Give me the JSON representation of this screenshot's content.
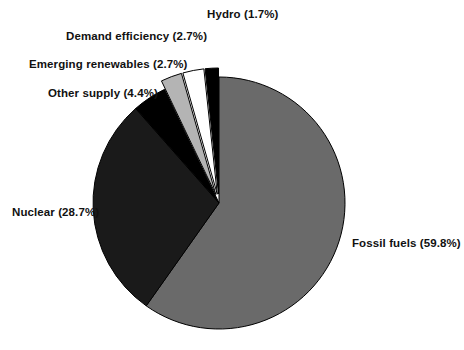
{
  "chart_data": {
    "type": "pie",
    "title": "",
    "subtitle": "",
    "xlabel": "",
    "ylabel": "",
    "legend_position": "none",
    "grid": false,
    "label_format": "{name} ({value}%)",
    "total_percent": 100.0,
    "categories": [
      "Fossil fuels",
      "Nuclear",
      "Other supply",
      "Emerging renewables",
      "Demand efficiency",
      "Hydro"
    ],
    "values": [
      59.8,
      28.7,
      4.4,
      2.7,
      2.7,
      1.7
    ],
    "slices": [
      {
        "name": "Fossil fuels",
        "value": 59.8,
        "label": "Fossil fuels (59.8%)",
        "fill": "#6a6a6a",
        "stroke": "#000000",
        "exploded": false
      },
      {
        "name": "Nuclear",
        "value": 28.7,
        "label": "Nuclear (28.7%)",
        "fill": "#1a1a1a",
        "stroke": "#000000",
        "exploded": false
      },
      {
        "name": "Other supply",
        "value": 4.4,
        "label": "Other supply (4.4%)",
        "fill": "#000000",
        "stroke": "#000000",
        "exploded": false
      },
      {
        "name": "Emerging renewables",
        "value": 2.7,
        "label": "Emerging renewables (2.7%)",
        "fill": "#b4b4b4",
        "stroke": "#000000",
        "exploded": true
      },
      {
        "name": "Demand efficiency",
        "value": 2.7,
        "label": "Demand efficiency (2.7%)",
        "fill": "#ffffff",
        "stroke": "#000000",
        "exploded": true
      },
      {
        "name": "Hydro",
        "value": 1.7,
        "label": "Hydro (1.7%)",
        "fill": "#000000",
        "stroke": "#000000",
        "exploded": true
      }
    ],
    "colors": {
      "fossil_fuels": "#6a6a6a",
      "nuclear": "#1a1a1a",
      "other_supply": "#000000",
      "emerging_renewables": "#b4b4b4",
      "demand_efficiency": "#ffffff",
      "hydro": "#000000",
      "background": "#ffffff",
      "text": "#111111",
      "outline": "#000000"
    }
  },
  "labels": {
    "fossil_fuels": "Fossil fuels (59.8%)",
    "nuclear": "Nuclear (28.7%)",
    "other_supply": "Other supply (4.4%)",
    "emerging_renewables": "Emerging renewables (2.7%)",
    "demand_efficiency": "Demand efficiency (2.7%)",
    "hydro": "Hydro (1.7%)"
  },
  "geometry": {
    "center_x": 219,
    "center_y": 203,
    "radius": 126,
    "start_angle_deg": -90,
    "explode_offset": 9
  }
}
